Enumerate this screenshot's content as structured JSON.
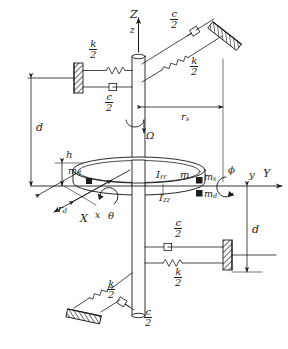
{
  "figure": {
    "type": "engineering-schematic",
    "axes": {
      "vertical_global": "Z",
      "vertical_local": "z",
      "horizontal_global": "Y",
      "horizontal_local": "y",
      "depth_global": "X",
      "depth_local": "x"
    },
    "labels": {
      "spin_speed": "Ω",
      "tilt_angle_yz": "ϕ",
      "tilt_angle_xz": "θ",
      "disk_mass": "m",
      "transverse_inertia": "I",
      "transverse_inertia_sub": "rr",
      "polar_inertia": "I",
      "polar_inertia_sub": "zz",
      "unbalance_mass": "m",
      "unbalance_mass_sub": "d",
      "shaft_mass": "m",
      "shaft_mass_sub": "s",
      "disk_radius": "r",
      "disk_radius_sub": "d",
      "shaft_radius": "r",
      "shaft_radius_sub": "s",
      "bearing_span": "d",
      "disk_thickness": "h"
    },
    "stiffness": {
      "numerator": "k",
      "denominator": "2"
    },
    "damping": {
      "numerator": "c",
      "denominator": "2"
    },
    "supports": [
      {
        "name": "upper-left-wall",
        "elements": [
          "k/2",
          "c/2"
        ],
        "orientation": "horizontal"
      },
      {
        "name": "upper-right-wall",
        "elements": [
          "c/2",
          "k/2"
        ],
        "orientation": "diagonal"
      },
      {
        "name": "lower-right-wall",
        "elements": [
          "c/2",
          "k/2"
        ],
        "orientation": "horizontal"
      },
      {
        "name": "lower-left-wall",
        "elements": [
          "k/2",
          "c/2"
        ],
        "orientation": "diagonal"
      }
    ],
    "colors": {
      "line": "#1c1c1c",
      "hatch": "#3a3a3a",
      "background": "#ffffff",
      "caption": "#8d8d8d"
    },
    "caption": ""
  }
}
